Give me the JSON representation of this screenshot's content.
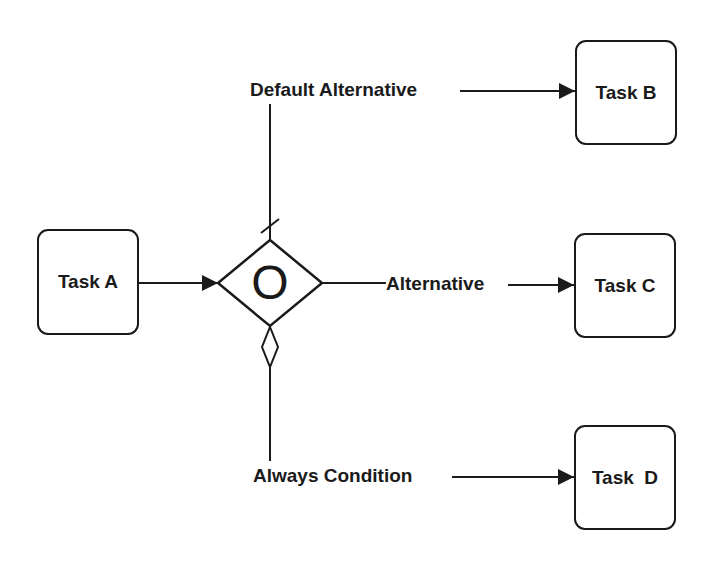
{
  "diagram": {
    "type": "process-flow-gateway",
    "colors": {
      "stroke": "#1a1a1a",
      "background": "#ffffff"
    },
    "tasks": [
      {
        "id": "A",
        "label": "Task A"
      },
      {
        "id": "B",
        "label": "Task B"
      },
      {
        "id": "C",
        "label": "Task C"
      },
      {
        "id": "D",
        "label": "Task  D"
      }
    ],
    "gateway": {
      "symbol": "O",
      "kind": "inclusive-or-gateway"
    },
    "flows": [
      {
        "from": "A",
        "to": "gateway",
        "label": ""
      },
      {
        "from": "gateway",
        "to": "B",
        "label": "Default Alternative",
        "marker": "default-slash"
      },
      {
        "from": "gateway",
        "to": "C",
        "label": "Alternative"
      },
      {
        "from": "gateway",
        "to": "D",
        "label": "Always Condition",
        "marker": "conditional-diamond"
      }
    ]
  }
}
